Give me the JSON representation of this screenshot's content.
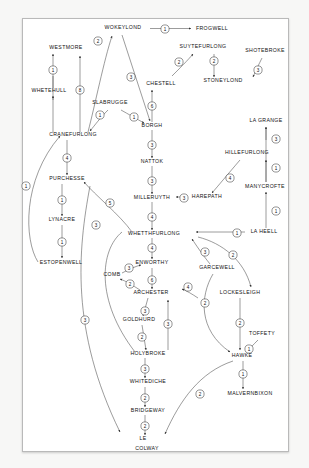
{
  "diagram": {
    "type": "directed-weighted-graph",
    "background_color": "#f7f7f6",
    "panel_color": "#ffffff",
    "border_color": "#b9b9b9",
    "ink_color": "#1a1a1a",
    "nodes": [
      {
        "id": "wokeylond",
        "label": "WOKEYLOND",
        "x": 123,
        "y": 29,
        "anchor": "middle"
      },
      {
        "id": "frogwell",
        "label": "FROGWELL",
        "x": 196,
        "y": 30,
        "anchor": "start"
      },
      {
        "id": "westmore",
        "label": "WESTMORE",
        "x": 66,
        "y": 49,
        "anchor": "middle"
      },
      {
        "id": "suytefurlong",
        "label": "SUYTEFURLONG",
        "x": 203,
        "y": 48,
        "anchor": "middle"
      },
      {
        "id": "shotebroke",
        "label": "SHOTEBROKE",
        "x": 265,
        "y": 52,
        "anchor": "middle"
      },
      {
        "id": "stoneylond",
        "label": "STONEYLOND",
        "x": 223,
        "y": 82,
        "anchor": "middle"
      },
      {
        "id": "chestell",
        "label": "CHESTELL",
        "x": 161,
        "y": 85,
        "anchor": "middle"
      },
      {
        "id": "whetehull",
        "label": "WHETEHULL",
        "x": 49,
        "y": 92,
        "anchor": "middle"
      },
      {
        "id": "slabrugge",
        "label": "SLABRUGGE",
        "x": 110,
        "y": 104,
        "anchor": "middle"
      },
      {
        "id": "borgh",
        "label": "BORGH",
        "x": 152,
        "y": 127,
        "anchor": "middle"
      },
      {
        "id": "la_grange",
        "label": "LA GRANGE",
        "x": 266,
        "y": 122,
        "anchor": "middle"
      },
      {
        "id": "cranefurlong",
        "label": "CRANEFURLONG",
        "x": 73,
        "y": 136,
        "anchor": "middle"
      },
      {
        "id": "nattok",
        "label": "NATTOK",
        "x": 152,
        "y": 163,
        "anchor": "middle"
      },
      {
        "id": "hillefurlong",
        "label": "HILLEFURLONG",
        "x": 247,
        "y": 154,
        "anchor": "middle"
      },
      {
        "id": "purchesse",
        "label": "PURCHESSE",
        "x": 67,
        "y": 180,
        "anchor": "middle"
      },
      {
        "id": "manycrofte",
        "label": "MANYCROFTE",
        "x": 265,
        "y": 188,
        "anchor": "middle"
      },
      {
        "id": "milleruyth",
        "label": "MILLERUYTH",
        "x": 152,
        "y": 199,
        "anchor": "middle"
      },
      {
        "id": "harepath",
        "label": "HAREPATH",
        "x": 207,
        "y": 198,
        "anchor": "middle"
      },
      {
        "id": "lynacre",
        "label": "LYNACRE",
        "x": 62,
        "y": 221,
        "anchor": "middle"
      },
      {
        "id": "whetthfurlong",
        "label": "WHETTHFURLONG",
        "x": 154,
        "y": 235,
        "anchor": "middle"
      },
      {
        "id": "la_heell",
        "label": "LA HEELL",
        "x": 264,
        "y": 233,
        "anchor": "middle"
      },
      {
        "id": "estopenwell",
        "label": "ESTOPENWELL",
        "x": 61,
        "y": 264,
        "anchor": "middle"
      },
      {
        "id": "enworthy",
        "label": "ENWORTHY",
        "x": 152,
        "y": 264,
        "anchor": "middle"
      },
      {
        "id": "garcewell",
        "label": "GARCEWELL",
        "x": 217,
        "y": 269,
        "anchor": "middle"
      },
      {
        "id": "comb",
        "label": "COMB",
        "x": 112,
        "y": 276,
        "anchor": "middle"
      },
      {
        "id": "lockesleigh",
        "label": "LOCKESLEIGH",
        "x": 240,
        "y": 294,
        "anchor": "middle"
      },
      {
        "id": "archester",
        "label": "ARCHESTER",
        "x": 151,
        "y": 294,
        "anchor": "middle"
      },
      {
        "id": "goldhurd",
        "label": "GOLDHURD",
        "x": 139,
        "y": 321,
        "anchor": "middle"
      },
      {
        "id": "toffety",
        "label": "TOFFETY",
        "x": 262,
        "y": 335,
        "anchor": "middle"
      },
      {
        "id": "holybroke",
        "label": "HOLYBROKE",
        "x": 148,
        "y": 355,
        "anchor": "middle"
      },
      {
        "id": "hawke",
        "label": "HAWKE",
        "x": 242,
        "y": 357,
        "anchor": "middle"
      },
      {
        "id": "whitediche",
        "label": "WHITEDICHE",
        "x": 148,
        "y": 383,
        "anchor": "middle"
      },
      {
        "id": "malvernbixon",
        "label": "MALVERNBIXON",
        "x": 250,
        "y": 395,
        "anchor": "middle"
      },
      {
        "id": "bridgeway",
        "label": "BRIDGEWAY",
        "x": 148,
        "y": 412,
        "anchor": "middle"
      },
      {
        "id": "le",
        "label": "LE",
        "x": 143,
        "y": 440,
        "anchor": "middle"
      },
      {
        "id": "colway",
        "label": "COLWAY",
        "x": 147,
        "y": 450,
        "anchor": "middle"
      }
    ],
    "edges": [
      {
        "from": "wokeylond",
        "to": "frogwell",
        "weight": 1
      },
      {
        "from": "cranefurlong",
        "to": "wokeylond",
        "weight": 2
      },
      {
        "from": "whetehull",
        "to": "westmore",
        "weight": 1
      },
      {
        "from": "cranefurlong",
        "to": "whetehull",
        "weight": 1
      },
      {
        "from": "cranefurlong",
        "to": "westmore",
        "weight": 8
      },
      {
        "from": "suytefurlong",
        "to": "stoneylond",
        "weight": 2
      },
      {
        "from": "chestell",
        "to": "suytefurlong",
        "weight": 2
      },
      {
        "from": "shotebroke",
        "to": "stoneylond",
        "weight": 3
      },
      {
        "from": "wokeylond",
        "to": "borgh",
        "weight": 3
      },
      {
        "from": "slabrugge",
        "to": "borgh",
        "weight": 1
      },
      {
        "from": "slabrugge",
        "to": "cranefurlong",
        "weight": 1
      },
      {
        "from": "borgh",
        "to": "chestell",
        "weight": 6
      },
      {
        "from": "borgh",
        "to": "nattok",
        "weight": 3
      },
      {
        "from": "nattok",
        "to": "milleruyth",
        "weight": 3
      },
      {
        "from": "cranefurlong",
        "to": "purchesse",
        "weight": 4
      },
      {
        "from": "purchesse",
        "to": "lynacre",
        "weight": 1
      },
      {
        "from": "lynacre",
        "to": "estopenwell",
        "weight": 1
      },
      {
        "from": "estopenwell",
        "to": "cranefurlong",
        "weight": 1
      },
      {
        "from": "milleruyth",
        "to": "whetthfurlong",
        "weight": 4
      },
      {
        "from": "harepath",
        "to": "milleruyth",
        "weight": 3
      },
      {
        "from": "hillefurlong",
        "to": "harepath",
        "weight": 4
      },
      {
        "from": "manycrofte",
        "to": "la_grange",
        "weight": 3
      },
      {
        "from": "manycrofte",
        "to": "hillefurlong",
        "weight": 1
      },
      {
        "from": "la_heell",
        "to": "manycrofte",
        "weight": 1
      },
      {
        "from": "la_heell",
        "to": "whetthfurlong",
        "weight": 1
      },
      {
        "from": "whetthfurlong",
        "to": "purchesse",
        "weight": 5
      },
      {
        "from": "whetthfurlong",
        "to": "enworthy",
        "weight": 4
      },
      {
        "from": "comb",
        "to": "enworthy",
        "weight": 3
      },
      {
        "from": "archester",
        "to": "comb",
        "weight": 2
      },
      {
        "from": "enworthy",
        "to": "archester",
        "weight": 6
      },
      {
        "from": "garcewell",
        "to": "whetthfurlong",
        "weight": 3
      },
      {
        "from": "whetthfurlong",
        "to": "lockesleigh",
        "weight": 2
      },
      {
        "from": "lockesleigh",
        "to": "garcewell",
        "weight": 4
      },
      {
        "from": "garcewell",
        "to": "hawke",
        "weight": 2
      },
      {
        "from": "lockesleigh",
        "to": "hawke",
        "weight": 2
      },
      {
        "from": "toffety",
        "to": "hawke",
        "weight": 1
      },
      {
        "from": "hawke",
        "to": "malvernbixon",
        "weight": 1
      },
      {
        "from": "archester",
        "to": "goldhurd",
        "weight": 3
      },
      {
        "from": "goldhurd",
        "to": "holybroke",
        "weight": 2
      },
      {
        "from": "holybroke",
        "to": "archester",
        "weight": 3
      },
      {
        "from": "holybroke",
        "to": "whitediche",
        "weight": 3
      },
      {
        "from": "whitediche",
        "to": "bridgeway",
        "weight": 2
      },
      {
        "from": "bridgeway",
        "to": "colway",
        "weight": 2
      },
      {
        "from": "purchesse",
        "to": "colway",
        "weight": 3
      },
      {
        "from": "hawke",
        "to": "colway",
        "weight": 2
      }
    ],
    "weight_markers": [
      {
        "id": "m-wokeylond-frogwell",
        "weight": 1,
        "x": 165,
        "y": 29
      },
      {
        "id": "m-cranefurlong-wokeylond",
        "weight": 2,
        "x": 98,
        "y": 41
      },
      {
        "id": "m-whetehull-westmore",
        "weight": 1,
        "x": 53,
        "y": 70
      },
      {
        "id": "m-cranefurlong-westmore",
        "weight": 8,
        "x": 80,
        "y": 90
      },
      {
        "id": "m-chestell-suytefurlong",
        "weight": 2,
        "x": 179,
        "y": 62
      },
      {
        "id": "m-suytefurlong-stoneylond",
        "weight": 2,
        "x": 214,
        "y": 61
      },
      {
        "id": "m-shotebroke-stoneylond",
        "weight": 3,
        "x": 258,
        "y": 70
      },
      {
        "id": "m-wokeylond-borgh",
        "weight": 3,
        "x": 131,
        "y": 77
      },
      {
        "id": "m-slabrugge-cranefurlong",
        "weight": 1,
        "x": 100,
        "y": 115
      },
      {
        "id": "m-slabrugge-borgh",
        "weight": 1,
        "x": 134,
        "y": 117
      },
      {
        "id": "m-borgh-chestell",
        "weight": 6,
        "x": 152,
        "y": 106
      },
      {
        "id": "m-manycrofte-lagrange",
        "weight": 3,
        "x": 276,
        "y": 139
      },
      {
        "id": "m-borgh-nattok",
        "weight": 3,
        "x": 152,
        "y": 145
      },
      {
        "id": "m-cranefurlong-purchesse",
        "weight": 4,
        "x": 67,
        "y": 158
      },
      {
        "id": "m-manycrofte-hillefurlong",
        "weight": 1,
        "x": 276,
        "y": 168
      },
      {
        "id": "m-hillefurlong-harepath",
        "weight": 4,
        "x": 230,
        "y": 178
      },
      {
        "id": "m-nattok-milleruyth",
        "weight": 3,
        "x": 152,
        "y": 181
      },
      {
        "id": "m-harepath-milleruyth",
        "weight": 3,
        "x": 184,
        "y": 198
      },
      {
        "id": "m-purchesse-lynacre",
        "weight": 1,
        "x": 62,
        "y": 200
      },
      {
        "id": "m-whetthfurlong-purchesse",
        "weight": 5,
        "x": 110,
        "y": 203
      },
      {
        "id": "m-milleruyth-whetthfurlong",
        "weight": 4,
        "x": 152,
        "y": 217
      },
      {
        "id": "m-laheell-manycrofte",
        "weight": 1,
        "x": 276,
        "y": 211
      },
      {
        "id": "m-estopenwell-cranefurlong",
        "weight": 1,
        "x": 26,
        "y": 186
      },
      {
        "id": "m-lynacre-estopenwell",
        "weight": 1,
        "x": 62,
        "y": 242
      },
      {
        "id": "m-purchesse-colway",
        "weight": 3,
        "x": 96,
        "y": 225
      },
      {
        "id": "m-laheell-whetthfurlong",
        "weight": 1,
        "x": 237,
        "y": 233
      },
      {
        "id": "m-garcewell-whetthfurlong",
        "weight": 3,
        "x": 205,
        "y": 252
      },
      {
        "id": "m-whetthfurlong-lockesleigh",
        "weight": 2,
        "x": 233,
        "y": 255
      },
      {
        "id": "m-whetthfurlong-enworthy",
        "weight": 4,
        "x": 152,
        "y": 248
      },
      {
        "id": "m-comb-enworthy",
        "weight": 3,
        "x": 129,
        "y": 268
      },
      {
        "id": "m-archester-comb",
        "weight": 2,
        "x": 130,
        "y": 284
      },
      {
        "id": "m-enworthy-archester",
        "weight": 6,
        "x": 152,
        "y": 280
      },
      {
        "id": "m-lockesleigh-garcewell",
        "weight": 4,
        "x": 188,
        "y": 287
      },
      {
        "id": "m-garcewell-hawke",
        "weight": 2,
        "x": 205,
        "y": 303
      },
      {
        "id": "m-archester-goldhurd",
        "weight": 3,
        "x": 145,
        "y": 311
      },
      {
        "id": "m-lockesleigh-hawke",
        "weight": 2,
        "x": 240,
        "y": 323
      },
      {
        "id": "m-toffety-hawke",
        "weight": 1,
        "x": 249,
        "y": 349
      },
      {
        "id": "m-purchesse-colway-mid",
        "weight": 3,
        "x": 85,
        "y": 320
      },
      {
        "id": "m-goldhurd-holybroke",
        "weight": 2,
        "x": 142,
        "y": 337
      },
      {
        "id": "m-holybroke-archester",
        "weight": 3,
        "x": 168,
        "y": 324
      },
      {
        "id": "m-hawke-malvernbixon",
        "weight": 1,
        "x": 243,
        "y": 374
      },
      {
        "id": "m-holybroke-whitediche",
        "weight": 3,
        "x": 145,
        "y": 369
      },
      {
        "id": "m-hawke-colway",
        "weight": 2,
        "x": 200,
        "y": 394
      },
      {
        "id": "m-whitediche-bridgeway",
        "weight": 2,
        "x": 145,
        "y": 398
      },
      {
        "id": "m-bridgeway-colway",
        "weight": 2,
        "x": 145,
        "y": 426
      }
    ]
  }
}
